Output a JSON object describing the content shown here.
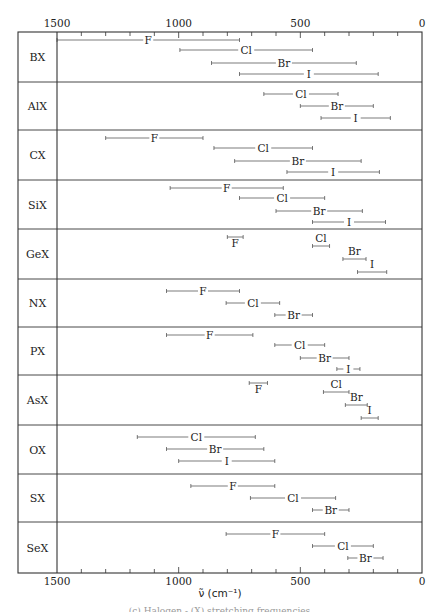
{
  "chart_data": {
    "type": "range-bar",
    "title": "",
    "xlabel": "ν̃ (cm⁻¹)",
    "ylabel": "",
    "xlim": [
      1500,
      0
    ],
    "x_reversed": true,
    "x_ticks": [
      1500,
      1000,
      500,
      0
    ],
    "x_minor_tick_step": 100,
    "grid": false,
    "legend": null,
    "rows": [
      {
        "label": "BX",
        "bars": [
          {
            "name": "F",
            "from": 1500,
            "to": 750
          },
          {
            "name": "Cl",
            "from": 995,
            "to": 450
          },
          {
            "name": "Br",
            "from": 865,
            "to": 270
          },
          {
            "name": "I",
            "from": 750,
            "to": 180
          }
        ]
      },
      {
        "label": "AlX",
        "bars": [
          {
            "name": "Cl",
            "from": 650,
            "to": 345
          },
          {
            "name": "Br",
            "from": 500,
            "to": 200
          },
          {
            "name": "I",
            "from": 415,
            "to": 130
          }
        ]
      },
      {
        "label": "CX",
        "bars": [
          {
            "name": "F",
            "from": 1300,
            "to": 900
          },
          {
            "name": "Cl",
            "from": 855,
            "to": 450
          },
          {
            "name": "Br",
            "from": 770,
            "to": 250
          },
          {
            "name": "I",
            "from": 555,
            "to": 175
          }
        ]
      },
      {
        "label": "SiX",
        "bars": [
          {
            "name": "F",
            "from": 1035,
            "to": 570
          },
          {
            "name": "Cl",
            "from": 750,
            "to": 400
          },
          {
            "name": "Br",
            "from": 600,
            "to": 245
          },
          {
            "name": "I",
            "from": 450,
            "to": 150
          }
        ]
      },
      {
        "label": "GeX",
        "bars": [
          {
            "name": "F",
            "from": 800,
            "to": 735,
            "label_pos": "below"
          },
          {
            "name": "Cl",
            "from": 450,
            "to": 380,
            "label_pos": "above"
          },
          {
            "name": "Br",
            "from": 325,
            "to": 230,
            "label_pos": "above"
          },
          {
            "name": "I",
            "from": 265,
            "to": 145,
            "label_pos": "above"
          }
        ]
      },
      {
        "label": "NX",
        "bars": [
          {
            "name": "F",
            "from": 1050,
            "to": 750
          },
          {
            "name": "Cl",
            "from": 805,
            "to": 585
          },
          {
            "name": "Br",
            "from": 605,
            "to": 450
          }
        ]
      },
      {
        "label": "PX",
        "bars": [
          {
            "name": "F",
            "from": 1050,
            "to": 695
          },
          {
            "name": "Cl",
            "from": 605,
            "to": 400
          },
          {
            "name": "Br",
            "from": 500,
            "to": 300
          },
          {
            "name": "I",
            "from": 350,
            "to": 255
          }
        ]
      },
      {
        "label": "AsX",
        "bars": [
          {
            "name": "F",
            "from": 710,
            "to": 635,
            "label_pos": "below"
          },
          {
            "name": "Cl",
            "from": 405,
            "to": 300,
            "label_pos": "above"
          },
          {
            "name": "Br",
            "from": 315,
            "to": 225,
            "label_pos": "above"
          },
          {
            "name": "I",
            "from": 250,
            "to": 180,
            "label_pos": "above"
          }
        ]
      },
      {
        "label": "OX",
        "bars": [
          {
            "name": "Cl",
            "from": 1170,
            "to": 685
          },
          {
            "name": "Br",
            "from": 1050,
            "to": 650
          },
          {
            "name": "I",
            "from": 1000,
            "to": 605
          }
        ]
      },
      {
        "label": "SX",
        "bars": [
          {
            "name": "F",
            "from": 950,
            "to": 605
          },
          {
            "name": "Cl",
            "from": 705,
            "to": 355
          },
          {
            "name": "Br",
            "from": 450,
            "to": 300
          }
        ]
      },
      {
        "label": "SeX",
        "bars": [
          {
            "name": "F",
            "from": 805,
            "to": 400
          },
          {
            "name": "Cl",
            "from": 450,
            "to": 200
          },
          {
            "name": "Br",
            "from": 305,
            "to": 160
          }
        ]
      }
    ]
  },
  "caption": "(c) Halogen - (X) stretching frequencies"
}
